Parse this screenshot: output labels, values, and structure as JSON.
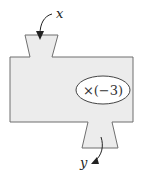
{
  "diagram": {
    "type": "function-machine",
    "input_label": "x",
    "output_label": "y",
    "operation": "×(−3)",
    "colors": {
      "fill": "#ececec",
      "stroke": "#6f6f6f",
      "ellipse_fill": "#ffffff",
      "arrow": "#222222"
    }
  }
}
